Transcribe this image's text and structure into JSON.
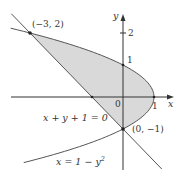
{
  "chart_data": {
    "type": "region-diagram",
    "title": "",
    "curves": [
      {
        "name": "parabola",
        "equation": "x = 1 - y^2",
        "label": "x = 1 − y²"
      },
      {
        "name": "line",
        "equation": "x + y + 1 = 0",
        "label": "x + y + 1 = 0"
      }
    ],
    "intersection_points": [
      {
        "x": -3,
        "y": 2,
        "label": "(−3, 2)"
      },
      {
        "x": 0,
        "y": -1,
        "label": "(0, −1)"
      }
    ],
    "shaded_region": "between line x+y+1=0 and parabola x=1−y² for −1 ≤ y ≤ 2",
    "axes": {
      "x_label": "x",
      "y_label": "y",
      "origin_label": "0",
      "x_ticks": [
        {
          "value": 1,
          "label": "1"
        }
      ],
      "y_ticks": [
        {
          "value": 1,
          "label": "1"
        },
        {
          "value": 2,
          "label": "2"
        }
      ],
      "x_range": [
        -3.6,
        1.6
      ],
      "y_range": [
        -2.3,
        2.6
      ]
    },
    "colors": {
      "shade": "#d9d9d9",
      "curve": "#555555",
      "axis": "#333333"
    }
  },
  "labels": {
    "point_a": "(−3, 2)",
    "point_b": "(0, −1)",
    "line_eq": "x + y + 1 = 0",
    "parabola_eq_prefix": "x = 1 − y",
    "parabola_eq_exp": "2",
    "x_axis": "x",
    "y_axis": "y",
    "origin": "0",
    "tick_x1": "1",
    "tick_y1": "1",
    "tick_y2": "2"
  }
}
